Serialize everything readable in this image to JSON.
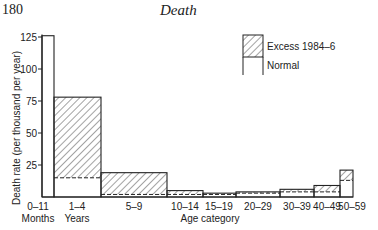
{
  "page": {
    "number": "180",
    "running_head": "Death"
  },
  "chart_data": {
    "type": "bar",
    "title": "",
    "xlabel": "Age category",
    "ylabel": "Death rate (per thousand per year)",
    "ylim": [
      0,
      125
    ],
    "yticks": [
      25,
      50,
      75,
      100,
      125
    ],
    "categories": [
      "0–11 Months",
      "1–4 Years",
      "5–9",
      "10–14",
      "15–19",
      "20–29",
      "30–39",
      "40–49",
      "50–59"
    ],
    "series": [
      {
        "name": "Normal",
        "values": [
          126,
          15,
          2,
          2,
          2,
          3,
          4,
          4,
          13
        ]
      },
      {
        "name": "Excess 1984–6",
        "values": [
          0,
          63,
          17,
          3,
          1,
          1,
          2,
          5,
          8
        ]
      }
    ],
    "totals": [
      126,
      78,
      19,
      5,
      3,
      4,
      6,
      9,
      21
    ],
    "legend": {
      "position": "upper right",
      "entries": [
        "Excess 1984–6",
        "Normal"
      ]
    },
    "grid": false
  },
  "axis": {
    "y_tick_labels": [
      "125",
      "100",
      "75",
      "50",
      "25"
    ],
    "x_tick_labels": [
      {
        "line1": "0–11",
        "line2": "Months"
      },
      {
        "line1": "1–4",
        "line2": "Years"
      },
      {
        "line1": "5–9"
      },
      {
        "line1": "10–14"
      },
      {
        "line1": "15–19"
      },
      {
        "line1": "20–29"
      },
      {
        "line1": "30–39"
      },
      {
        "line1": "40–49"
      },
      {
        "line1": "50–59"
      }
    ]
  }
}
